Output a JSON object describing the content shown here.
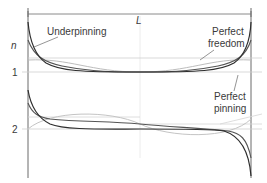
{
  "diagram": {
    "title_length_label": "L",
    "y_axis_label": "n",
    "modes": [
      {
        "label": "1"
      },
      {
        "label": "2"
      }
    ],
    "annotations": {
      "underpinning": "Underpinning",
      "perfect_freedom_line1": "Perfect",
      "perfect_freedom_line2": "freedom",
      "perfect_pinning_line1": "Perfect",
      "perfect_pinning_line2": "pinning"
    },
    "curves": [
      {
        "name": "Underpinning",
        "color": "#555555"
      },
      {
        "name": "Perfect freedom",
        "color": "#bdbdbd"
      },
      {
        "name": "Perfect pinning",
        "color": "#2e2e2e"
      }
    ],
    "colors": {
      "axis": "#6a6a6a",
      "reference_line": "#c8c8c8",
      "dark_curve": "#2e2e2e",
      "mid_curve": "#555555",
      "light_curve": "#bdbdbd"
    }
  }
}
